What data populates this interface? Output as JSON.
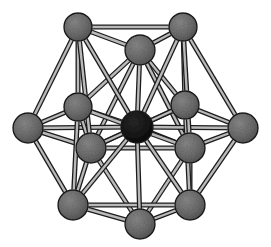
{
  "figure": {
    "width": 271,
    "height": 247,
    "background_color": "#ffffff",
    "caption": "",
    "shell_atom_color": "#6a6a6a",
    "center_atom_color": "#111111",
    "atom_outline_color": "#1a1a1a",
    "bond_outline_color": "#1c1c1c",
    "bond_fill_color": "#b9b9b9",
    "atom_count": 13,
    "shell_atom_count": 12,
    "center_atom_count": 1
  },
  "chart_data": {
    "type": "diagram",
    "subtitle": "",
    "xlabel": "",
    "ylabel": "",
    "grid": false,
    "legend": [],
    "annotations": [],
    "nodes": [
      {
        "id": "top-left",
        "label": "",
        "x": 78,
        "y": 27,
        "r": 14,
        "kind": "shell",
        "color": "#6a6a6a",
        "z": 3
      },
      {
        "id": "top-center",
        "label": "",
        "x": 140,
        "y": 50,
        "r": 15,
        "kind": "shell",
        "color": "#6a6a6a",
        "z": 5
      },
      {
        "id": "top-right",
        "label": "",
        "x": 183,
        "y": 27,
        "r": 14,
        "kind": "shell",
        "color": "#6a6a6a",
        "z": 3
      },
      {
        "id": "mid-upper-left",
        "label": "",
        "x": 78,
        "y": 107,
        "r": 14,
        "kind": "shell",
        "color": "#6a6a6a",
        "z": 6
      },
      {
        "id": "mid-upper-right",
        "label": "",
        "x": 185,
        "y": 105,
        "r": 14,
        "kind": "shell",
        "color": "#6a6a6a",
        "z": 6
      },
      {
        "id": "far-left",
        "label": "",
        "x": 28,
        "y": 128,
        "r": 15,
        "kind": "shell",
        "color": "#6a6a6a",
        "z": 2
      },
      {
        "id": "far-right",
        "label": "",
        "x": 243,
        "y": 128,
        "r": 15,
        "kind": "shell",
        "color": "#6a6a6a",
        "z": 2
      },
      {
        "id": "center",
        "label": "",
        "x": 137,
        "y": 127,
        "r": 16,
        "kind": "center",
        "color": "#111111",
        "z": 7
      },
      {
        "id": "mid-lower-left",
        "label": "",
        "x": 91,
        "y": 148,
        "r": 15,
        "kind": "shell",
        "color": "#6a6a6a",
        "z": 8
      },
      {
        "id": "mid-lower-right",
        "label": "",
        "x": 190,
        "y": 148,
        "r": 15,
        "kind": "shell",
        "color": "#6a6a6a",
        "z": 8
      },
      {
        "id": "bottom-left",
        "label": "",
        "x": 73,
        "y": 205,
        "r": 15,
        "kind": "shell",
        "color": "#6a6a6a",
        "z": 9
      },
      {
        "id": "bottom-center",
        "label": "",
        "x": 140,
        "y": 224,
        "r": 15,
        "kind": "shell",
        "color": "#6a6a6a",
        "z": 10
      },
      {
        "id": "bottom-right",
        "label": "",
        "x": 190,
        "y": 205,
        "r": 15,
        "kind": "shell",
        "color": "#6a6a6a",
        "z": 9
      }
    ],
    "edges": [
      {
        "from": "top-left",
        "to": "top-center",
        "width": 5
      },
      {
        "from": "top-center",
        "to": "top-right",
        "width": 5
      },
      {
        "from": "top-left",
        "to": "top-right",
        "width": 5
      },
      {
        "from": "top-left",
        "to": "mid-upper-left",
        "width": 5
      },
      {
        "from": "top-left",
        "to": "far-left",
        "width": 5
      },
      {
        "from": "top-right",
        "to": "mid-upper-right",
        "width": 5
      },
      {
        "from": "top-right",
        "to": "far-right",
        "width": 5
      },
      {
        "from": "top-center",
        "to": "mid-upper-left",
        "width": 5
      },
      {
        "from": "top-center",
        "to": "mid-upper-right",
        "width": 5
      },
      {
        "from": "top-center",
        "to": "center",
        "width": 5
      },
      {
        "from": "top-center",
        "to": "mid-lower-left",
        "width": 5
      },
      {
        "from": "top-center",
        "to": "mid-lower-right",
        "width": 5
      },
      {
        "from": "top-left",
        "to": "center",
        "width": 5
      },
      {
        "from": "top-right",
        "to": "center",
        "width": 5
      },
      {
        "from": "far-left",
        "to": "mid-upper-left",
        "width": 5
      },
      {
        "from": "far-left",
        "to": "mid-lower-left",
        "width": 5
      },
      {
        "from": "far-left",
        "to": "center",
        "width": 5
      },
      {
        "from": "far-left",
        "to": "bottom-left",
        "width": 5
      },
      {
        "from": "far-right",
        "to": "mid-upper-right",
        "width": 5
      },
      {
        "from": "far-right",
        "to": "mid-lower-right",
        "width": 5
      },
      {
        "from": "far-right",
        "to": "center",
        "width": 5
      },
      {
        "from": "far-right",
        "to": "bottom-right",
        "width": 5
      },
      {
        "from": "mid-upper-left",
        "to": "center",
        "width": 5
      },
      {
        "from": "mid-upper-right",
        "to": "center",
        "width": 5
      },
      {
        "from": "mid-lower-left",
        "to": "center",
        "width": 5
      },
      {
        "from": "mid-lower-right",
        "to": "center",
        "width": 5
      },
      {
        "from": "mid-upper-left",
        "to": "mid-lower-left",
        "width": 5
      },
      {
        "from": "mid-upper-right",
        "to": "mid-lower-right",
        "width": 5
      },
      {
        "from": "mid-upper-left",
        "to": "mid-lower-right",
        "width": 5
      },
      {
        "from": "mid-upper-right",
        "to": "mid-lower-left",
        "width": 5
      },
      {
        "from": "mid-lower-left",
        "to": "mid-lower-right",
        "width": 5
      },
      {
        "from": "mid-lower-left",
        "to": "bottom-left",
        "width": 5
      },
      {
        "from": "mid-lower-left",
        "to": "bottom-center",
        "width": 5
      },
      {
        "from": "mid-lower-right",
        "to": "bottom-right",
        "width": 5
      },
      {
        "from": "mid-lower-right",
        "to": "bottom-center",
        "width": 5
      },
      {
        "from": "mid-upper-left",
        "to": "bottom-left",
        "width": 5
      },
      {
        "from": "mid-upper-right",
        "to": "bottom-right",
        "width": 5
      },
      {
        "from": "bottom-left",
        "to": "bottom-center",
        "width": 5
      },
      {
        "from": "bottom-center",
        "to": "bottom-right",
        "width": 5
      },
      {
        "from": "bottom-left",
        "to": "bottom-right",
        "width": 5
      },
      {
        "from": "bottom-center",
        "to": "center",
        "width": 5
      },
      {
        "from": "bottom-left",
        "to": "center",
        "width": 5
      },
      {
        "from": "bottom-right",
        "to": "center",
        "width": 5
      },
      {
        "from": "top-left",
        "to": "mid-lower-left",
        "width": 5
      },
      {
        "from": "top-right",
        "to": "mid-lower-right",
        "width": 5
      }
    ]
  }
}
